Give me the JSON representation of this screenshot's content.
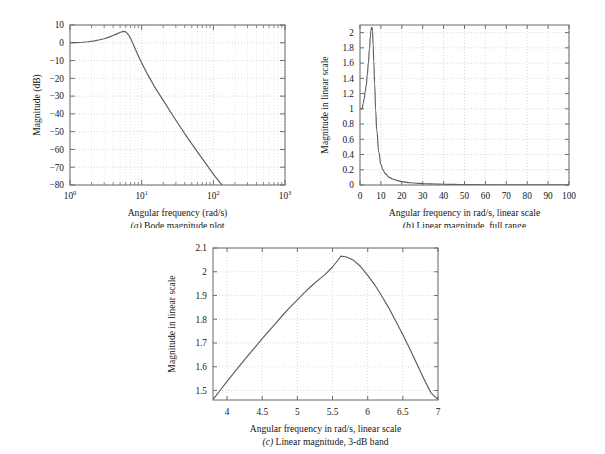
{
  "page": {
    "background": "#ffffff",
    "curve_color": "#5a5e5e",
    "grid_color": "#c9c9c9",
    "axis_color": "#666a6a"
  },
  "figures": [
    {
      "id": "a",
      "caption_label": "(a)",
      "caption_text": " Bode magnitude plot",
      "xlabel": "Angular frequency (rad/s)",
      "ylabel": "Magnitude (dB)",
      "xticklabels": [
        "10⁰",
        "10¹",
        "10²",
        "10³"
      ],
      "yticklabels": [
        "10",
        "0",
        "−10",
        "−20",
        "−30",
        "−40",
        "−50",
        "−60",
        "−70",
        "−80"
      ]
    },
    {
      "id": "b",
      "caption_label": "(b)",
      "caption_text": " Linear magnitude, full range",
      "xlabel": "Angular frequency in rad/s, linear scale",
      "ylabel": "Magnitude in linear scale",
      "xticklabels": [
        "0",
        "10",
        "20",
        "30",
        "40",
        "50",
        "60",
        "70",
        "80",
        "90",
        "100"
      ],
      "yticklabels": [
        "0",
        "0.2",
        "0.4",
        "0.6",
        "0.8",
        "1",
        "1.2",
        "1.4",
        "1.6",
        "1.8",
        "2"
      ]
    },
    {
      "id": "c",
      "caption_label": "(c)",
      "caption_text": " Linear magnitude, 3-dB band",
      "xlabel": "Angular frequency in rad/s, linear scale",
      "ylabel": "Magnitude in linear scale",
      "xticklabels": [
        "4",
        "4.5",
        "5",
        "5.5",
        "6",
        "6.5",
        "7"
      ],
      "yticklabels": [
        "1.5",
        "1.6",
        "1.7",
        "1.8",
        "1.9",
        "2",
        "2.1"
      ]
    }
  ],
  "chart_data": [
    {
      "type": "line",
      "id": "a",
      "title": "(a) Bode magnitude plot",
      "xlabel": "Angular frequency (rad/s)",
      "ylabel": "Magnitude (dB)",
      "xscale": "log",
      "yscale": "linear",
      "xlim": [
        1,
        1000
      ],
      "ylim": [
        -80,
        10
      ],
      "xticks": [
        1,
        10,
        100,
        1000
      ],
      "xticklabels": [
        "10^0",
        "10^1",
        "10^2",
        "10^3"
      ],
      "yticks": [
        10,
        0,
        -10,
        -20,
        -30,
        -40,
        -50,
        -60,
        -70,
        -80
      ],
      "grid": true,
      "legend": "none",
      "x": [
        1.0,
        1.2,
        1.5,
        1.8,
        2.2,
        2.6,
        3.0,
        3.5,
        4.0,
        4.5,
        5.0,
        5.2,
        5.4,
        5.6,
        5.8,
        6.0,
        6.3,
        6.6,
        7.0,
        7.5,
        8.0,
        9.0,
        10.0,
        12.0,
        15.0,
        20.0,
        30.0,
        40.0,
        60.0,
        80.0,
        100.0,
        150.0,
        200.0,
        300.0,
        500.0,
        700.0,
        1000.0
      ],
      "y": [
        0.0,
        0.1,
        0.3,
        0.6,
        1.1,
        1.7,
        2.3,
        3.2,
        4.1,
        5.0,
        5.8,
        6.1,
        6.3,
        6.4,
        6.3,
        6.1,
        5.3,
        4.2,
        2.5,
        -0.2,
        -2.8,
        -7.4,
        -11.3,
        -17.5,
        -24.5,
        -32.4,
        -43.6,
        -51.2,
        -61.4,
        -68.4,
        -73.9,
        -82.9,
        -89.2,
        -98.1,
        -109.0,
        -116.2,
        -125.0
      ]
    },
    {
      "type": "line",
      "id": "b",
      "title": "(b) Linear magnitude, full range",
      "xlabel": "Angular frequency in rad/s, linear scale",
      "ylabel": "Magnitude in linear scale",
      "xscale": "linear",
      "yscale": "linear",
      "xlim": [
        0,
        100
      ],
      "ylim": [
        0,
        2.1
      ],
      "xticks": [
        0,
        10,
        20,
        30,
        40,
        50,
        60,
        70,
        80,
        90,
        100
      ],
      "yticks": [
        0,
        0.2,
        0.4,
        0.6,
        0.8,
        1.0,
        1.2,
        1.4,
        1.6,
        1.8,
        2.0
      ],
      "grid": true,
      "legend": "none",
      "peak": {
        "x": 5.6,
        "y": 2.07
      },
      "x": [
        0,
        0.5,
        1,
        1.5,
        2,
        2.5,
        3,
        3.5,
        4,
        4.5,
        5,
        5.2,
        5.4,
        5.6,
        5.8,
        6,
        6.3,
        6.6,
        7,
        7.5,
        8,
        9,
        10,
        11,
        12,
        14,
        16,
        18,
        20,
        24,
        28,
        32,
        36,
        40,
        45,
        50,
        60,
        70,
        80,
        90,
        100
      ],
      "y": [
        1.0,
        1.0,
        1.0,
        1.07,
        1.13,
        1.23,
        1.31,
        1.45,
        1.6,
        1.78,
        1.95,
        2.02,
        2.06,
        2.07,
        2.06,
        2.02,
        1.84,
        1.62,
        1.33,
        0.98,
        0.72,
        0.43,
        0.27,
        0.2,
        0.15,
        0.1,
        0.075,
        0.057,
        0.045,
        0.03,
        0.022,
        0.017,
        0.013,
        0.01,
        0.008,
        0.006,
        0.004,
        0.003,
        0.002,
        0.0015,
        0.001
      ]
    },
    {
      "type": "line",
      "id": "c",
      "title": "(c) Linear magnitude, 3-dB band",
      "xlabel": "Angular frequency in rad/s, linear scale",
      "ylabel": "Magnitude in linear scale",
      "xscale": "linear",
      "yscale": "linear",
      "xlim": [
        3.8,
        7.0
      ],
      "ylim": [
        1.46,
        2.1
      ],
      "xticks": [
        4,
        4.5,
        5,
        5.5,
        6,
        6.5,
        7
      ],
      "yticks": [
        1.5,
        1.6,
        1.7,
        1.8,
        1.9,
        2.0,
        2.1
      ],
      "grid": true,
      "legend": "none",
      "peak": {
        "x": 5.62,
        "y": 2.066
      },
      "x": [
        3.8,
        3.9,
        4.0,
        4.1,
        4.2,
        4.3,
        4.4,
        4.5,
        4.6,
        4.7,
        4.8,
        4.9,
        5.0,
        5.1,
        5.2,
        5.3,
        5.4,
        5.5,
        5.6,
        5.62,
        5.7,
        5.8,
        5.9,
        6.0,
        6.1,
        6.2,
        6.3,
        6.4,
        6.5,
        6.6,
        6.7,
        6.8,
        6.9,
        7.0
      ],
      "y": [
        1.462,
        1.5,
        1.538,
        1.575,
        1.612,
        1.648,
        1.683,
        1.718,
        1.752,
        1.786,
        1.82,
        1.852,
        1.882,
        1.912,
        1.94,
        1.966,
        1.99,
        2.02,
        2.058,
        2.066,
        2.062,
        2.048,
        2.022,
        1.985,
        1.945,
        1.898,
        1.848,
        1.792,
        1.735,
        1.675,
        1.612,
        1.548,
        1.49,
        1.462
      ]
    }
  ]
}
